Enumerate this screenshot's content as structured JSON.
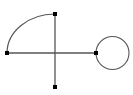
{
  "figure": {
    "kind": "graph-diagram",
    "canvas": {
      "width": 133,
      "height": 95,
      "background": "#ffffff"
    },
    "style": {
      "edge_color": "#555555",
      "edge_width": 1.2,
      "loop_color": "#555555",
      "loop_width": 1.1,
      "vertex_color": "#000000",
      "vertex_size": 4,
      "vertex_shape": "square"
    },
    "vertices": [
      {
        "id": "v-left",
        "label": "",
        "x": 7,
        "y": 53
      },
      {
        "id": "v-top",
        "label": "",
        "x": 55,
        "y": 14
      },
      {
        "id": "v-bottom",
        "label": "",
        "x": 55,
        "y": 87
      },
      {
        "id": "v-right",
        "label": "",
        "x": 96,
        "y": 53
      }
    ],
    "edges": [
      {
        "id": "edge-arc-left-top",
        "from": "v-left",
        "to": "v-top",
        "shape": "arc",
        "path": "M 7 53 A 48 39 0 0 1 55 14"
      },
      {
        "id": "edge-horizontal-left-right",
        "from": "v-left",
        "to": "v-right",
        "shape": "line",
        "path": "M 7 53 L 96 53"
      },
      {
        "id": "edge-vertical-top-bottom",
        "from": "v-top",
        "to": "v-bottom",
        "shape": "line",
        "path": "M 55 14 L 55 87"
      }
    ],
    "loops": [
      {
        "id": "loop-right",
        "at": "v-right",
        "shape": "circle",
        "cx": 112.5,
        "cy": 53,
        "r": 16.5
      }
    ]
  }
}
